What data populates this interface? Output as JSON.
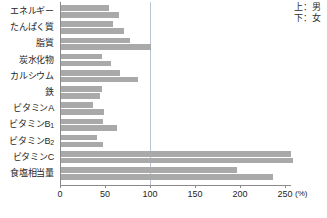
{
  "legend": {
    "top_label": "上：男",
    "bottom_label": "下：女"
  },
  "axis": {
    "unit": "(%)",
    "tick_labels": [
      "0",
      "50",
      "100",
      "150",
      "200",
      "250"
    ]
  },
  "caption": "",
  "chart_data": {
    "type": "bar",
    "orientation": "horizontal",
    "title": "",
    "subtitle": "",
    "xlabel": "(%)",
    "ylabel": "",
    "xlim": [
      0,
      265
    ],
    "xticks": [
      0,
      50,
      100,
      150,
      200,
      250
    ],
    "grid": false,
    "reference_line": 100,
    "legend_position": "top-right",
    "bar_color": "#a9a9a9",
    "categories": [
      "エネルギー",
      "たんぱく質",
      "脂質",
      "炭水化物",
      "カルシウム",
      "鉄",
      "ビタミンA",
      "ビタミンB1",
      "ビタミンB2",
      "ビタミンC",
      "食塩相当量"
    ],
    "series": [
      {
        "name": "上：男",
        "values": [
          53,
          58,
          77,
          45,
          65,
          46,
          35,
          47,
          40,
          255,
          195
        ]
      },
      {
        "name": "下：女",
        "values": [
          64,
          70,
          100,
          56,
          85,
          43,
          48,
          62,
          47,
          258,
          235
        ]
      }
    ]
  }
}
